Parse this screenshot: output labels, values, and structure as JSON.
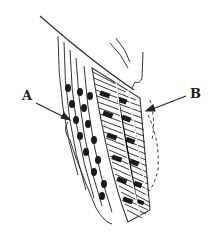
{
  "figure": {
    "labels": [
      {
        "id": "A",
        "text": "A"
      },
      {
        "id": "B",
        "text": "B"
      }
    ],
    "colors": {
      "ink": "#222222",
      "background": "#ffffff"
    }
  }
}
